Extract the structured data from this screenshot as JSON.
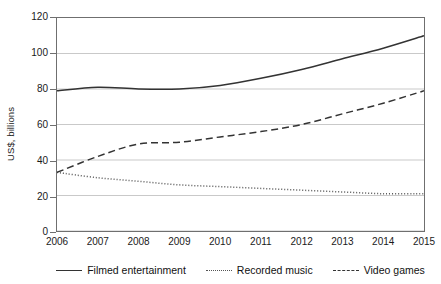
{
  "chart_data": {
    "type": "line",
    "title": "",
    "xlabel": "",
    "ylabel": "US$, billions",
    "categories": [
      "2006",
      "2007",
      "2008",
      "2009",
      "2010",
      "2011",
      "2012",
      "2013",
      "2014",
      "2015"
    ],
    "x": [
      2006,
      2007,
      2008,
      2009,
      2010,
      2011,
      2012,
      2013,
      2014,
      2015
    ],
    "ylim": [
      0,
      120
    ],
    "yticks": [
      "0",
      "20",
      "40",
      "60",
      "80",
      "100",
      "120"
    ],
    "ytick_values": [
      0,
      20,
      40,
      60,
      80,
      100,
      120
    ],
    "grid": "horizontal",
    "legend_position": "bottom",
    "series": [
      {
        "name": "Filmed entertainment",
        "style": "solid",
        "color": "#333333",
        "values": [
          79,
          81,
          80,
          80,
          82,
          86,
          91,
          97,
          103,
          110
        ]
      },
      {
        "name": "Recorded music",
        "style": "dotted",
        "color": "#555555",
        "values": [
          33,
          30,
          28,
          26,
          25,
          24,
          23,
          22,
          21,
          21
        ]
      },
      {
        "name": "Video games",
        "style": "dashed",
        "color": "#333333",
        "values": [
          33,
          42,
          49,
          50,
          53,
          56,
          60,
          66,
          72,
          79
        ]
      }
    ]
  },
  "axis": {
    "y_label": "US$, billions",
    "y_ticks": [
      "120",
      "100",
      "80",
      "60",
      "40",
      "20",
      "0"
    ],
    "x_ticks": [
      "2006",
      "2007",
      "2008",
      "2009",
      "2010",
      "2011",
      "2012",
      "2013",
      "2014",
      "2015"
    ]
  },
  "legend": {
    "items": [
      {
        "label": "Filmed entertainment",
        "style": "solid"
      },
      {
        "label": "Recorded music",
        "style": "dotted"
      },
      {
        "label": "Video games",
        "style": "dashed"
      }
    ]
  }
}
